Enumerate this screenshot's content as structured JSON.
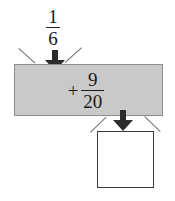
{
  "diagram": {
    "type": "function-machine",
    "background_color": "#ffffff",
    "input": {
      "label": "1/6",
      "numerator": "1",
      "denominator": "6"
    },
    "operation": {
      "operator": "+",
      "operand_numerator": "9",
      "operand_denominator": "20",
      "label": "+ 9/20",
      "box_fill_color": "#c9c9c9",
      "box_border_color": "#8d8d8d"
    },
    "output": {
      "label": "",
      "box_fill_color": "#ffffff",
      "box_border_color": "#3a3a3a"
    },
    "arrows": {
      "input_arrow": "arrow-down",
      "output_arrow": "arrow-down",
      "color": "#2b2b2b"
    },
    "funnel_lines": {
      "color": "#6e6e6e",
      "count": "4"
    }
  }
}
